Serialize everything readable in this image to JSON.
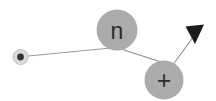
{
  "diagram": {
    "type": "particle-interaction",
    "background_color": "#ffffff",
    "nodes": [
      {
        "id": "electron",
        "name": "electron-particle",
        "label": "",
        "symbol": "dot",
        "cx": 20.5,
        "cy": 57,
        "r": 7.5,
        "inner_r": 3.4,
        "fill": "#d6d6d6",
        "inner_fill": "#333333",
        "stroke": "#c0c0c0"
      },
      {
        "id": "neutron",
        "name": "neutron-particle",
        "label": "n",
        "symbol": "n",
        "cx": 117,
        "cy": 30,
        "r": 20.5,
        "fill": "#ababab",
        "text_color": "#2b2b2b"
      },
      {
        "id": "proton",
        "name": "proton-particle",
        "label": "+",
        "symbol": "plus",
        "cx": 164,
        "cy": 80,
        "r": 19.5,
        "fill": "#ababab",
        "text_color": "#2b2b2b"
      }
    ],
    "edges": [
      {
        "id": "electron-to-neutron",
        "name": "track-electron-neutron",
        "from": "electron",
        "to": "neutron",
        "x1": 28,
        "y1": 56,
        "x2": 111,
        "y2": 48,
        "stroke": "#9a9a9a",
        "width": 1
      },
      {
        "id": "neutron-to-proton",
        "name": "track-neutron-proton",
        "from": "neutron",
        "to": "proton",
        "x1": 122,
        "y1": 49,
        "x2": 160,
        "y2": 61,
        "stroke": "#8e8e8e",
        "width": 1
      },
      {
        "id": "proton-to-arrow",
        "name": "track-proton-arrow",
        "from": "proton",
        "to": "arrowhead",
        "x1": 173,
        "y1": 65,
        "x2": 194,
        "y2": 35,
        "stroke": "#8e8e8e",
        "width": 1
      }
    ],
    "arrowhead": {
      "name": "arrowhead-marker",
      "tip_x": 195,
      "tip_y": 44,
      "points": "186,27 204,25 195,44",
      "fill": "#1c1c1c"
    }
  }
}
